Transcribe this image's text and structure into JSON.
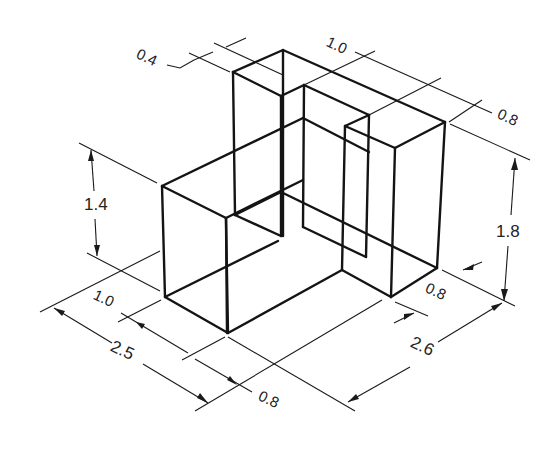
{
  "figure": {
    "type": "isometric-wireframe-with-dimensions",
    "stroke_color": "#141414",
    "background": "#ffffff"
  },
  "dimensions": {
    "d_0_4": "0.4",
    "d_1_0_top": "1.0",
    "d_0_8_top": "0.8",
    "d_1_4": "1.4",
    "d_1_8": "1.8",
    "d_1_0_left": "1.0",
    "d_2_5": "2.5",
    "d_0_8_bottom": "0.8",
    "d_0_8_right": "0.8",
    "d_2_6": "2.6"
  }
}
